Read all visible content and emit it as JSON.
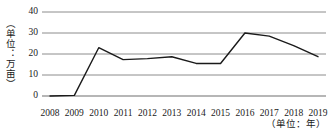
{
  "chart_data": {
    "type": "line",
    "title": "",
    "xlabel": "（单位：年）",
    "ylabel": "（单位：万亩）",
    "categories": [
      "2008",
      "2009",
      "2010",
      "2011",
      "2012",
      "2013",
      "2014",
      "2015",
      "2016",
      "2017",
      "2018",
      "2019"
    ],
    "values": [
      0,
      0.3,
      23,
      17.3,
      17.8,
      18.7,
      15.5,
      15.5,
      30,
      28.5,
      24,
      18.7
    ],
    "series": [
      {
        "name": "",
        "values": [
          0,
          0.3,
          23,
          17.3,
          17.8,
          18.7,
          15.5,
          15.5,
          30,
          28.5,
          24,
          18.7
        ]
      }
    ],
    "ylim": [
      0,
      40
    ],
    "yticks": [
      0,
      10,
      20,
      30,
      40
    ],
    "ytick_labels": [
      "0",
      "10",
      "20",
      "30",
      "40"
    ],
    "grid": "horizontal",
    "legend": "none",
    "line_color": "#1a1a1a",
    "grid_color": "#8c8c8c",
    "axis_color": "#6e6e6e"
  }
}
